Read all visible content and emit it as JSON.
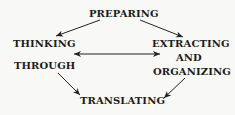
{
  "diagram": {
    "nodes": {
      "preparing": "PREPARING",
      "thinking_line1": "THINKING",
      "thinking_line2": "THROUGH",
      "extracting_line1": "EXTRACTING",
      "extracting_line2": "AND",
      "extracting_line3": "ORGANIZING",
      "translating": "TRANSLATING"
    },
    "edges": [
      {
        "from": "PREPARING",
        "to": "THINKING THROUGH",
        "type": "directed"
      },
      {
        "from": "PREPARING",
        "to": "EXTRACTING AND ORGANIZING",
        "type": "directed"
      },
      {
        "from": "THINKING THROUGH",
        "to": "EXTRACTING AND ORGANIZING",
        "type": "bidirectional"
      },
      {
        "from": "THINKING THROUGH",
        "to": "TRANSLATING",
        "type": "directed"
      },
      {
        "from": "EXTRACTING AND ORGANIZING",
        "to": "TRANSLATING",
        "type": "directed"
      }
    ],
    "colors": {
      "text": "#1c1c1c",
      "arrow": "#222222",
      "background": "#f8f8f6"
    }
  }
}
